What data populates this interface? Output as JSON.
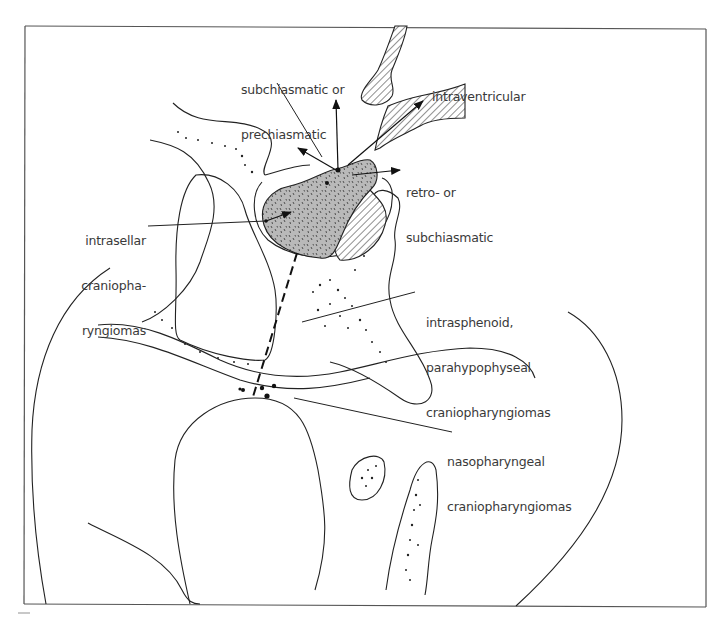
{
  "figure": {
    "colors": {
      "frame": "#555555",
      "line": "#222222",
      "tumor_fill": "#b9b9b9",
      "text": "#3a3a3a"
    }
  },
  "labels": {
    "subchiasmatic": {
      "line1": "subchiasmatic or",
      "line2": "prechiasmatic"
    },
    "intraventricular": {
      "line1": "intraventricular"
    },
    "retro": {
      "line1": "retro- or",
      "line2": "subchiasmatic"
    },
    "intrasellar": {
      "line1": "intrasellar",
      "line2": "craniopha-",
      "line3": "ryngiomas"
    },
    "intrasphenoid": {
      "line1": "intrasphenoid,",
      "line2": "parahypophyseal",
      "line3": "craniopharyngiomas"
    },
    "nasopharyngeal": {
      "line1": "nasopharyngeal",
      "line2": "craniopharyngiomas"
    }
  }
}
